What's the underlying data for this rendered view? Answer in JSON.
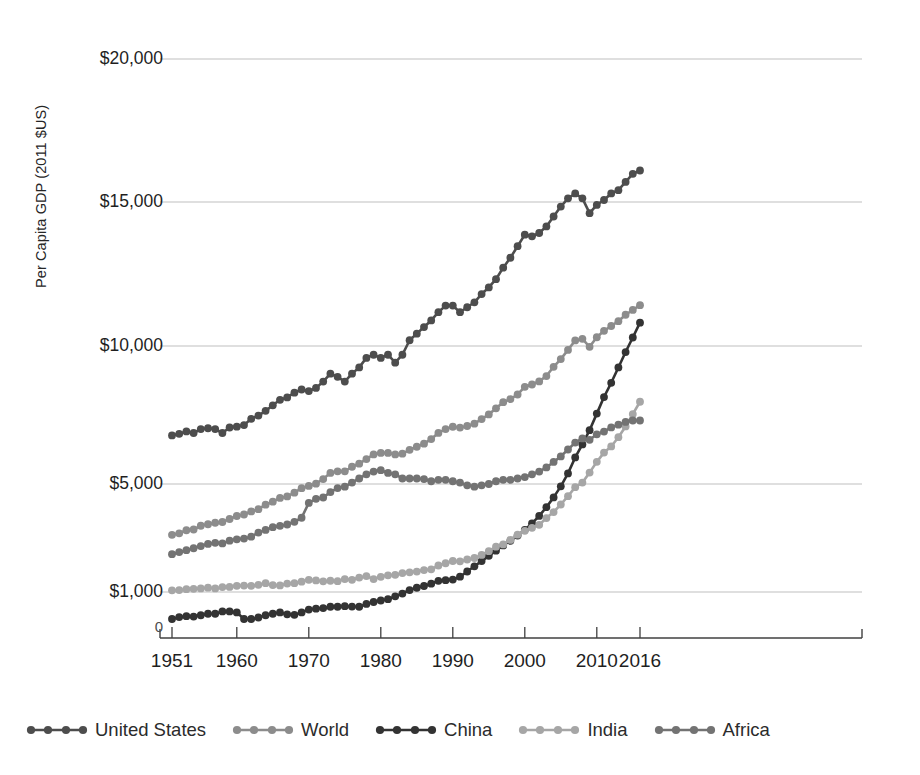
{
  "chart_data": {
    "type": "line",
    "title": "",
    "xlabel": "",
    "ylabel": "Per Capita GDP (2011 $US)",
    "xlim": [
      1951,
      2016
    ],
    "ylim": [
      0,
      20000
    ],
    "grid": true,
    "legend_position": "bottom",
    "x_tick_labels": [
      "1951",
      "1960",
      "1970",
      "1980",
      "1990",
      "2000",
      "2010",
      "2016"
    ],
    "x_ticks": [
      1951,
      1960,
      1970,
      1980,
      1990,
      2000,
      2010,
      2016
    ],
    "y_tick_labels": [
      "0",
      "$1,000",
      "$5,000",
      "$10,000",
      "$15,000",
      "$20,000"
    ],
    "y_ticks": [
      0,
      1000,
      5000,
      10000,
      15000,
      20000
    ],
    "x": [
      1951,
      1952,
      1953,
      1954,
      1955,
      1956,
      1957,
      1958,
      1959,
      1960,
      1961,
      1962,
      1963,
      1964,
      1965,
      1966,
      1967,
      1968,
      1969,
      1970,
      1971,
      1972,
      1973,
      1974,
      1975,
      1976,
      1977,
      1978,
      1979,
      1980,
      1981,
      1982,
      1983,
      1984,
      1985,
      1986,
      1987,
      1988,
      1989,
      1990,
      1991,
      1992,
      1993,
      1994,
      1995,
      1996,
      1997,
      1998,
      1999,
      2000,
      2001,
      2002,
      2003,
      2004,
      2005,
      2006,
      2007,
      2008,
      2009,
      2010,
      2011,
      2012,
      2013,
      2014,
      2015,
      2016
    ],
    "series": [
      {
        "name": "United States",
        "color": "#4d4d4d",
        "values": [
          11800,
          11900,
          12050,
          11950,
          12200,
          12250,
          12200,
          11950,
          12300,
          12350,
          12450,
          12850,
          13050,
          13350,
          13700,
          14050,
          14200,
          14500,
          14700,
          14600,
          14800,
          15200,
          15700,
          15500,
          15200,
          15700,
          16100,
          16700,
          16900,
          16700,
          16900,
          16400,
          16900,
          17800,
          18200,
          18600,
          19000,
          19500,
          19900,
          19900,
          19500,
          19800,
          20100,
          20600,
          21000,
          21500,
          22200,
          22800,
          23500,
          24200,
          24100,
          24300,
          24700,
          25300,
          25900,
          26400,
          26700,
          26400,
          25500,
          26000,
          26300,
          26700,
          26900,
          27400,
          27900,
          28100
        ]
      },
      {
        "name": "World",
        "color": "#8c8c8c",
        "values": [
          5600,
          5700,
          5900,
          5950,
          6200,
          6300,
          6400,
          6450,
          6650,
          6850,
          6950,
          7150,
          7300,
          7600,
          7800,
          8050,
          8150,
          8400,
          8700,
          8850,
          9000,
          9300,
          9700,
          9800,
          9800,
          10100,
          10300,
          10600,
          10900,
          11000,
          11000,
          10900,
          10950,
          11200,
          11400,
          11600,
          11900,
          12300,
          12550,
          12700,
          12650,
          12750,
          12900,
          13200,
          13500,
          13900,
          14300,
          14500,
          14800,
          15300,
          15450,
          15650,
          16000,
          16600,
          17100,
          17700,
          18300,
          18400,
          17900,
          18500,
          18900,
          19200,
          19500,
          19900,
          20200,
          20500
        ]
      },
      {
        "name": "China",
        "color": "#333333",
        "values": [
          900,
          1000,
          1050,
          1030,
          1100,
          1180,
          1180,
          1300,
          1300,
          1250,
          900,
          900,
          980,
          1100,
          1180,
          1250,
          1150,
          1120,
          1250,
          1400,
          1450,
          1480,
          1550,
          1550,
          1580,
          1560,
          1550,
          1700,
          1800,
          1880,
          1950,
          2100,
          2250,
          2500,
          2700,
          2850,
          3050,
          3300,
          3350,
          3400,
          3650,
          4100,
          4550,
          5000,
          5450,
          5900,
          6350,
          6750,
          7200,
          7700,
          8250,
          8900,
          9650,
          10500,
          11450,
          12550,
          13900,
          15000,
          16200,
          17600,
          19000,
          20200,
          21500,
          22800,
          24000,
          25200
        ]
      },
      {
        "name": "India",
        "color": "#a6a6a6",
        "values": [
          1900,
          1920,
          1980,
          2000,
          2030,
          2080,
          2030,
          2120,
          2130,
          2200,
          2220,
          2200,
          2270,
          2380,
          2250,
          2230,
          2350,
          2380,
          2480,
          2600,
          2560,
          2500,
          2540,
          2510,
          2650,
          2600,
          2750,
          2850,
          2650,
          2800,
          2900,
          2930,
          3050,
          3100,
          3150,
          3250,
          3300,
          3550,
          3700,
          3850,
          3830,
          3950,
          4050,
          4250,
          4500,
          4800,
          4950,
          5250,
          5600,
          5850,
          6050,
          6250,
          6700,
          7100,
          7600,
          8150,
          8750,
          9050,
          9700,
          10400,
          11000,
          11400,
          12000,
          12700,
          13500,
          14300
        ]
      },
      {
        "name": "Africa",
        "color": "#737373",
        "values": [
          2400,
          2480,
          2550,
          2620,
          2700,
          2780,
          2820,
          2800,
          2900,
          2950,
          2980,
          3050,
          3200,
          3300,
          3400,
          3450,
          3500,
          3600,
          3750,
          4300,
          4450,
          4500,
          4700,
          4850,
          4900,
          5050,
          5200,
          5350,
          5450,
          5500,
          5400,
          5350,
          5200,
          5200,
          5200,
          5180,
          5100,
          5150,
          5150,
          5100,
          5050,
          4950,
          4900,
          4950,
          5000,
          5100,
          5150,
          5150,
          5200,
          5250,
          5350,
          5450,
          5600,
          5800,
          6000,
          6250,
          6500,
          6650,
          6600,
          6800,
          6900,
          7050,
          7150,
          7250,
          7300,
          7300
        ]
      }
    ]
  },
  "legend": {
    "items": [
      {
        "label": "United States",
        "color": "#4d4d4d"
      },
      {
        "label": "World",
        "color": "#8c8c8c"
      },
      {
        "label": "China",
        "color": "#333333"
      },
      {
        "label": "India",
        "color": "#a6a6a6"
      },
      {
        "label": "Africa",
        "color": "#737373"
      }
    ]
  },
  "axes": {
    "y_title": "Per Capita GDP (2011 $US)",
    "gridline_color": "#b5b5b5",
    "axis_color": "#404040"
  }
}
